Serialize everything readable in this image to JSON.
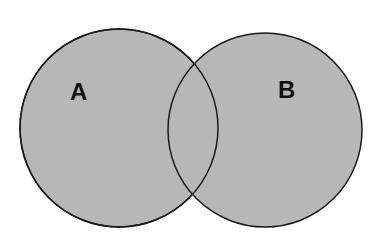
{
  "diagram": {
    "type": "venn",
    "sets": [
      {
        "id": "A",
        "label": "A",
        "cx": 119,
        "cy": 128,
        "r": 99
      },
      {
        "id": "B",
        "label": "B",
        "cx": 265,
        "cy": 130,
        "r": 97
      }
    ],
    "colors": {
      "fill": "#b7b7b7",
      "stroke": "#1a1a1a",
      "background": "#ffffff",
      "text": "#111111"
    }
  }
}
